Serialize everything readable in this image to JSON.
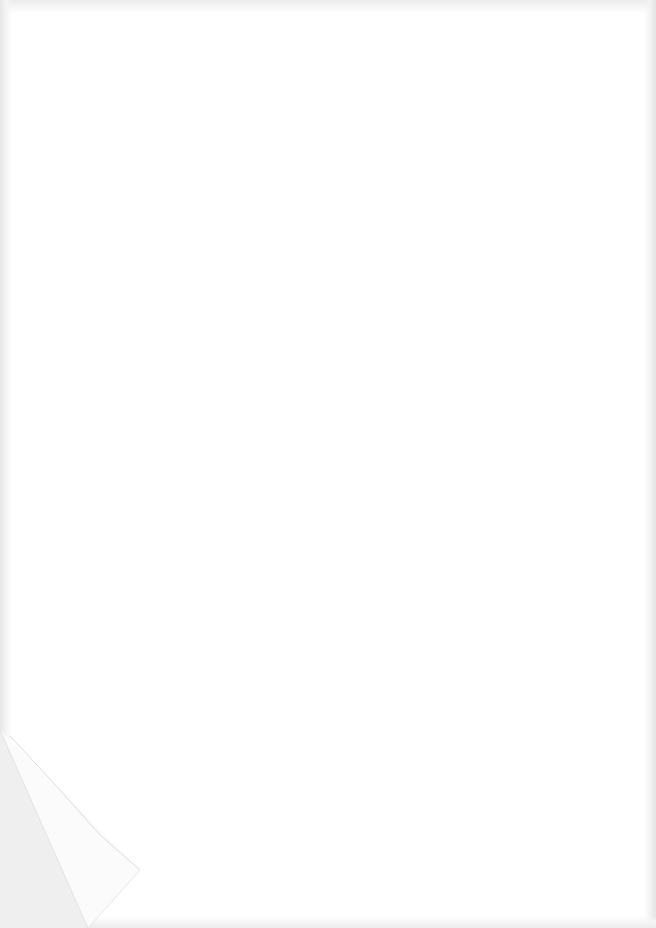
{
  "page": {
    "type": "blank-scanned-sheet",
    "background_color": "#ffffff",
    "edge_shade_color": "#e8e8e8",
    "folded_corner": "bottom-left",
    "text": ""
  }
}
